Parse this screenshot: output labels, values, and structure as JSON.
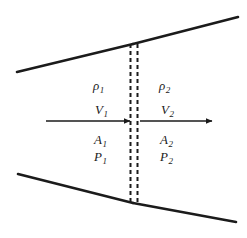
{
  "diagram": {
    "colors": {
      "line": "#1b1b1b",
      "dashed": "#1b1b1b",
      "background": "#ffffff",
      "text": "#1b1b1b"
    },
    "upstream": {
      "density": "ρ",
      "density_sub": "1",
      "velocity": "V",
      "velocity_sub": "1",
      "area": "A",
      "area_sub": "1",
      "pressure": "P",
      "pressure_sub": "1"
    },
    "downstream": {
      "density": "ρ",
      "density_sub": "2",
      "velocity": "V",
      "velocity_sub": "2",
      "area": "A",
      "area_sub": "2",
      "pressure": "P",
      "pressure_sub": "2"
    },
    "walls": {
      "top_left": {
        "x1": 17,
        "y1": 72,
        "x2": 133,
        "y2": 44
      },
      "top_right": {
        "x1": 133,
        "y1": 44,
        "x2": 238,
        "y2": 17
      },
      "bottom_left": {
        "x1": 18,
        "y1": 174,
        "x2": 133,
        "y2": 203
      },
      "bottom_right": {
        "x1": 133,
        "y1": 203,
        "x2": 236,
        "y2": 222
      }
    },
    "disk": {
      "line_a_x": 130,
      "line_b_x": 137,
      "y_top": 44,
      "y_bottom": 204,
      "dash_pattern": "4 3"
    },
    "arrows": {
      "upstream": {
        "x1": 46,
        "y1": 121,
        "x2": 130,
        "y2": 121
      },
      "downstream": {
        "x1": 140,
        "y1": 121,
        "x2": 212,
        "y2": 121
      }
    }
  }
}
